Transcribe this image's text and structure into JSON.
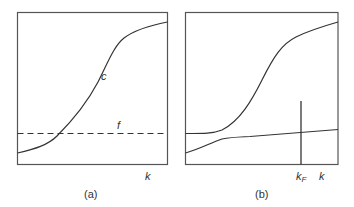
{
  "colors": {
    "background": "#ffffff",
    "frame": "#555555",
    "curve": "#333333",
    "text": "#333333"
  },
  "panels": [
    {
      "id": "a",
      "caption": "(a)",
      "x_axis_label": "k",
      "curves": [
        {
          "name": "c",
          "label": "c",
          "style": "solid",
          "shape": "sigmoid rising"
        },
        {
          "name": "f",
          "label": "f",
          "style": "dashed",
          "shape": "horizontal constant"
        }
      ]
    },
    {
      "id": "b",
      "caption": "(b)",
      "x_axis_label": "k",
      "marker": {
        "label_main": "k",
        "label_sub": "F",
        "style": "vertical line"
      },
      "curves": [
        {
          "name": "upper",
          "style": "solid",
          "shape": "flat then sigmoid rising"
        },
        {
          "name": "lower",
          "style": "solid",
          "shape": "small rise then slow linear increase"
        }
      ]
    }
  ]
}
